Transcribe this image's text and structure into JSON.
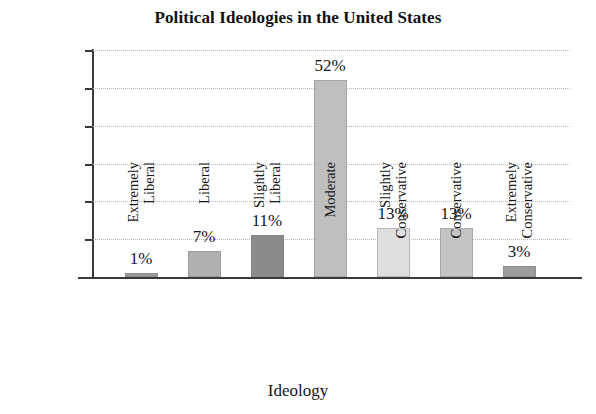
{
  "chart_data": {
    "type": "bar",
    "title": "Political Ideologies in the United States",
    "xlabel": "Ideology",
    "ylabel": "Percentage of Voters",
    "categories": [
      "Extremely Liberal",
      "Liberal",
      "Slightly Liberal",
      "Moderate",
      "Slightly Conservative",
      "Conservative",
      "Extremely Conservative"
    ],
    "category_lines": [
      [
        "Extremely",
        "Liberal"
      ],
      [
        "Liberal"
      ],
      [
        "Slightly",
        "Liberal"
      ],
      [
        "Moderate"
      ],
      [
        "Slightly",
        "Conservative"
      ],
      [
        "Conservative"
      ],
      [
        "Extremely",
        "Conservative"
      ]
    ],
    "values": [
      1,
      7,
      11,
      52,
      13,
      13,
      3
    ],
    "value_labels": [
      "1%",
      "7%",
      "11%",
      "52%",
      "13%",
      "13%",
      "3%"
    ],
    "bar_colors": [
      "#9a9a9a",
      "#b0b0b0",
      "#8a8a8a",
      "#bfbfbf",
      "#dedede",
      "#c4c4c4",
      "#9d9d9d"
    ],
    "ylim": [
      0,
      60
    ],
    "ytick_values": [
      60,
      50,
      40,
      30,
      20,
      10
    ],
    "ytick_labels": [
      "60%",
      "50%",
      "40%",
      "30%",
      "20%",
      "10%"
    ],
    "grid": true,
    "grid_style": "dotted",
    "legend": "none",
    "axis_color": "#3a3a3a",
    "background": "#ffffff"
  }
}
